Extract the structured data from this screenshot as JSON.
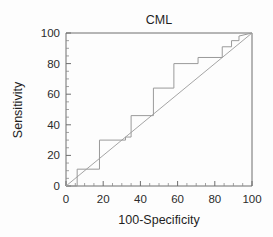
{
  "chart_data": {
    "type": "line",
    "title": "CML",
    "xlabel": "100-Specificity",
    "ylabel": "Sensitivity",
    "xlim": [
      0,
      100
    ],
    "ylim": [
      0,
      100
    ],
    "xticks": [
      0,
      20,
      40,
      60,
      80,
      100
    ],
    "yticks": [
      0,
      20,
      40,
      60,
      80,
      100
    ],
    "xtick_labels": [
      "0",
      "20",
      "40",
      "60",
      "80",
      "100"
    ],
    "ytick_labels": [
      "0",
      "20",
      "40",
      "60",
      "80",
      "100"
    ],
    "minor_tick_interval": 5,
    "grid": false,
    "legend": "none",
    "series": [
      {
        "name": "ROC curve",
        "style": "step",
        "color": "#9a9a9a",
        "x": [
          0,
          6,
          6,
          11,
          18,
          18,
          32,
          32,
          35,
          35,
          47,
          47,
          58,
          58,
          71,
          71,
          84,
          84,
          89,
          89,
          93,
          93,
          100
        ],
        "y": [
          0,
          0,
          11,
          11,
          11,
          30,
          30,
          32,
          32,
          46,
          46,
          64,
          64,
          80,
          80,
          84,
          84,
          91,
          91,
          95,
          95,
          98,
          100
        ]
      },
      {
        "name": "Reference diagonal",
        "style": "line",
        "color": "#a5a5a5",
        "x": [
          0,
          100
        ],
        "y": [
          0,
          100
        ]
      }
    ]
  },
  "figure": {
    "title": "CML",
    "x_axis_title": "100-Specificity",
    "y_axis_title": "Sensitivity"
  }
}
